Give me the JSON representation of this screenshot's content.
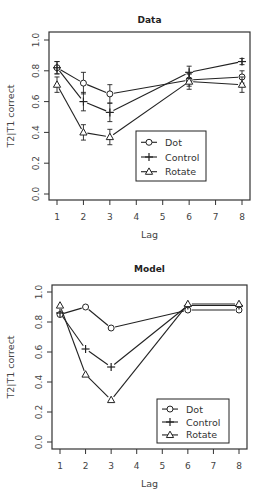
{
  "chart_data": [
    {
      "type": "line",
      "title": "Data",
      "xlabel": "Lag",
      "ylabel": "T2|T1 correct",
      "x": [
        1,
        2,
        3,
        6,
        8
      ],
      "xticks": [
        "1",
        "2",
        "3",
        "4",
        "5",
        "6",
        "7",
        "8"
      ],
      "yticks": [
        "0.0",
        "0.2",
        "0.4",
        "0.6",
        "0.8",
        "1.0"
      ],
      "ylim": [
        0,
        1
      ],
      "xlim": [
        1,
        8
      ],
      "grid": false,
      "legend_position": "center-right",
      "series": [
        {
          "name": "Dot",
          "marker": "circle",
          "values": [
            0.82,
            0.72,
            0.65,
            0.74,
            0.76
          ],
          "err": [
            0.04,
            0.07,
            0.06,
            0.04,
            0.04
          ]
        },
        {
          "name": "Control",
          "marker": "plus",
          "values": [
            0.82,
            0.6,
            0.53,
            0.79,
            0.86
          ],
          "err": [
            0.04,
            0.06,
            0.06,
            0.04,
            0.02
          ]
        },
        {
          "name": "Rotate",
          "marker": "triangle",
          "values": [
            0.71,
            0.4,
            0.37,
            0.73,
            0.71
          ],
          "err": [
            0.05,
            0.05,
            0.05,
            0.05,
            0.05
          ]
        }
      ]
    },
    {
      "type": "line",
      "title": "Model",
      "xlabel": "Lag",
      "ylabel": "T2|T1 correct",
      "x": [
        1,
        2,
        3,
        6,
        8
      ],
      "xticks": [
        "1",
        "2",
        "3",
        "4",
        "5",
        "6",
        "7",
        "8"
      ],
      "yticks": [
        "0.0",
        "0.2",
        "0.4",
        "0.6",
        "0.8",
        "1.0"
      ],
      "ylim": [
        0,
        1
      ],
      "xlim": [
        1,
        8
      ],
      "grid": false,
      "legend_position": "bottom-right",
      "series": [
        {
          "name": "Dot",
          "marker": "circle",
          "values": [
            0.85,
            0.9,
            0.76,
            0.88,
            0.88
          ]
        },
        {
          "name": "Control",
          "marker": "plus",
          "values": [
            0.86,
            0.62,
            0.5,
            0.91,
            0.91
          ]
        },
        {
          "name": "Rotate",
          "marker": "triangle",
          "values": [
            0.91,
            0.45,
            0.28,
            0.92,
            0.92
          ]
        }
      ]
    }
  ],
  "colors": {
    "line": "#222222",
    "axis": "#333333",
    "text": "#444444"
  }
}
